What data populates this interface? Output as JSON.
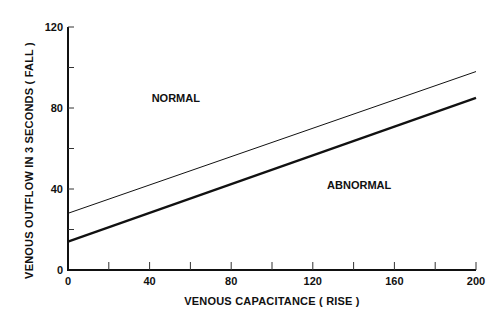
{
  "chart_data": {
    "type": "line",
    "title": "",
    "xlabel": "VENOUS CAPACITANCE ( RISE )",
    "ylabel": "VENOUS OUTFLOW IN 3 SECONDS ( FALL )",
    "xlim": [
      0,
      200
    ],
    "ylim": [
      0,
      120
    ],
    "x_ticks": [
      0,
      20,
      40,
      60,
      80,
      100,
      120,
      140,
      160,
      180,
      200
    ],
    "x_tick_labels": [
      "0",
      "40",
      "80",
      "120",
      "160",
      "200"
    ],
    "x_tick_label_values": [
      0,
      40,
      80,
      120,
      160,
      200
    ],
    "y_ticks": [
      0,
      20,
      40,
      60,
      80,
      100,
      120
    ],
    "y_tick_labels": [
      "0",
      "40",
      "80",
      "120"
    ],
    "y_tick_label_values": [
      0,
      40,
      80,
      120
    ],
    "grid": false,
    "legend": null,
    "series": [
      {
        "name": "upper boundary (thin)",
        "x": [
          0,
          200
        ],
        "values": [
          28,
          98
        ],
        "stroke_width": 1
      },
      {
        "name": "lower boundary (thick)",
        "x": [
          0,
          200
        ],
        "values": [
          14,
          85
        ],
        "stroke_width": 2.2
      }
    ],
    "annotations": [
      {
        "text": "NORMAL",
        "x": 41,
        "y": 83
      },
      {
        "text": "ABNORMAL",
        "x": 127,
        "y": 40
      }
    ]
  }
}
